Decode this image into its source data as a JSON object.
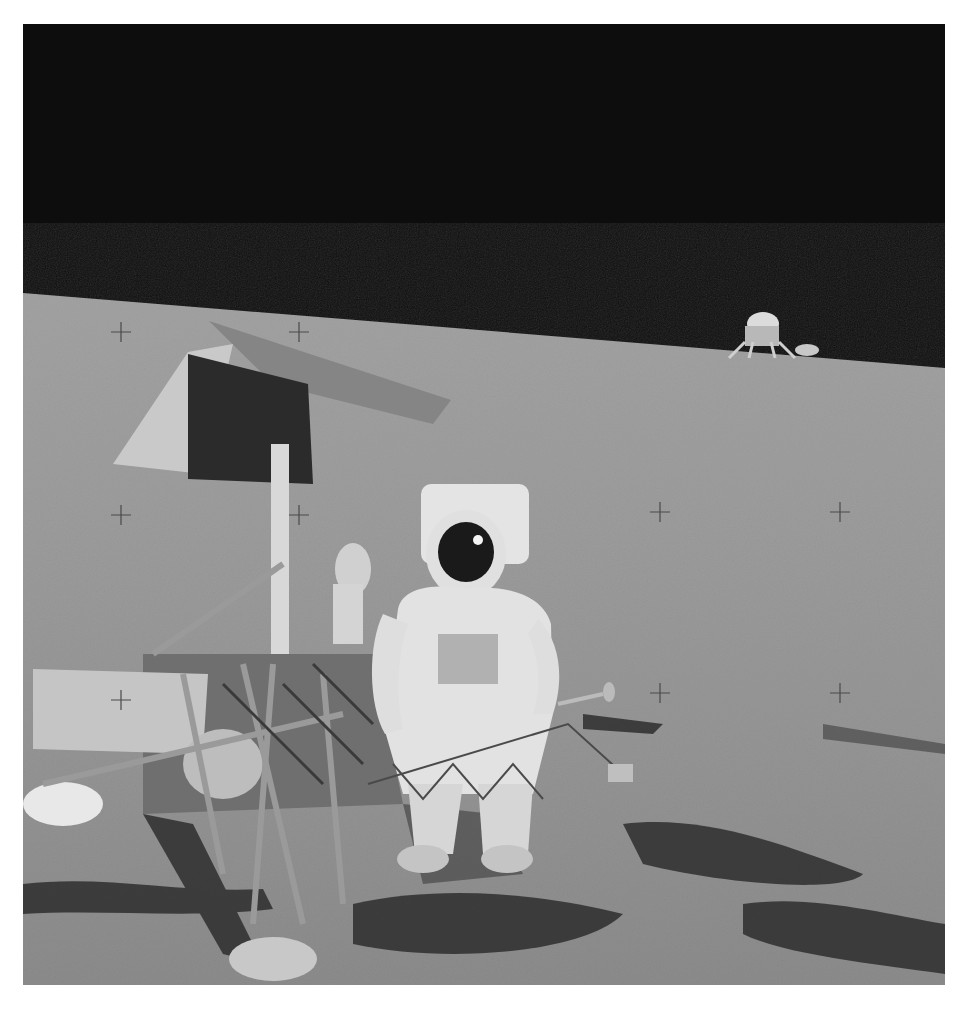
{
  "image": {
    "kind": "photograph",
    "subject": "astronaut standing beside lander probe on lunar surface, lunar module on horizon",
    "frame": {
      "x": 23,
      "y": 24,
      "width": 922,
      "height": 961,
      "border_color": "#ffffff"
    },
    "colors": {
      "sky": "#0d0d0d",
      "ground_far": "#9a9a9a",
      "ground_near": "#8a8a8a",
      "shadow": "#2a2a2a",
      "suit": "#e6e6e6",
      "visor": "#1a1a1a",
      "panel_dark": "#2b2b2b",
      "panel_light": "#c8c8c8",
      "antenna": "#858585",
      "reticle": "#4a4a4a"
    },
    "horizon": {
      "left_y": 293,
      "right_y": 368
    },
    "reticle_marks": [
      {
        "x": 121,
        "y": 332
      },
      {
        "x": 299,
        "y": 332
      },
      {
        "x": 121,
        "y": 515
      },
      {
        "x": 299,
        "y": 515
      },
      {
        "x": 660,
        "y": 512
      },
      {
        "x": 840,
        "y": 512
      },
      {
        "x": 121,
        "y": 700
      },
      {
        "x": 660,
        "y": 693
      },
      {
        "x": 840,
        "y": 693
      }
    ]
  }
}
